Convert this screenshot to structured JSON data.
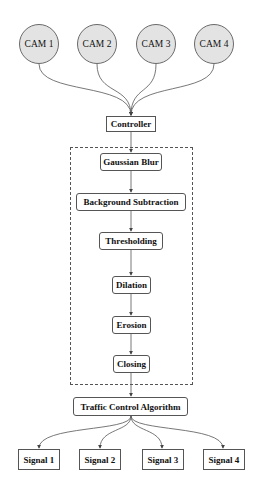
{
  "diagram": {
    "cameras": [
      {
        "label": "CAM 1"
      },
      {
        "label": "CAM 2"
      },
      {
        "label": "CAM 3"
      },
      {
        "label": "CAM 4"
      }
    ],
    "controller": {
      "label": "Controller"
    },
    "processing_steps": [
      {
        "label": "Gaussian Blur"
      },
      {
        "label": "Background Subtraction"
      },
      {
        "label": "Thresholding"
      },
      {
        "label": "Dilation"
      },
      {
        "label": "Erosion"
      },
      {
        "label": "Closing"
      }
    ],
    "algorithm": {
      "label": "Traffic Control Algorithm"
    },
    "signals": [
      {
        "label": "Signal 1"
      },
      {
        "label": "Signal 2"
      },
      {
        "label": "Signal 3"
      },
      {
        "label": "Signal 4"
      }
    ],
    "colors": {
      "camera_fill": "#e3e3e3",
      "stroke": "#555555",
      "background": "#ffffff"
    }
  }
}
